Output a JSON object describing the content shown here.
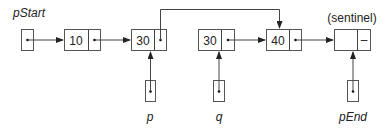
{
  "diagram": {
    "type": "linked-list",
    "labels": {
      "pStart": "pStart",
      "sentinel": "(sentinel)",
      "p": "p",
      "q": "q",
      "pEnd": "pEnd"
    },
    "nodes": [
      {
        "id": "n1",
        "value": "10"
      },
      {
        "id": "n2",
        "value": "30"
      },
      {
        "id": "n3",
        "value": "30"
      },
      {
        "id": "n4",
        "value": "40"
      },
      {
        "id": "sentinel",
        "value": "",
        "next": "–"
      }
    ],
    "pointers": [
      {
        "name": "pStart",
        "target": "n1"
      },
      {
        "name": "p",
        "target": "n2"
      },
      {
        "name": "q",
        "target": "n3"
      },
      {
        "name": "pEnd",
        "target": "sentinel"
      }
    ],
    "links": [
      {
        "from": "n1",
        "to": "n2"
      },
      {
        "from": "n2",
        "to": "n4",
        "note": "bypasses n3"
      },
      {
        "from": "n3",
        "to": "n4"
      },
      {
        "from": "n4",
        "to": "sentinel"
      }
    ]
  }
}
